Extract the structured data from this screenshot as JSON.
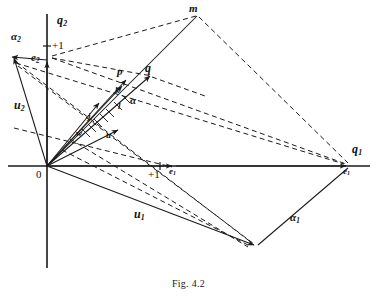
{
  "figure": {
    "caption": "Fig. 4.2",
    "ink_color": "#1a1a1a",
    "background_color": "#ffffff",
    "width": 377,
    "height": 302
  },
  "axes": {
    "origin_label": "0",
    "origin": {
      "x": 47,
      "y": 166
    },
    "horizontal": {
      "name": "q1-axis",
      "label": "q",
      "subscript": "1",
      "x1": 8,
      "x2": 370,
      "y": 166
    },
    "vertical": {
      "name": "q2-axis",
      "label": "q",
      "subscript": "2",
      "y1": 14,
      "y2": 268,
      "x": 47
    }
  },
  "unit_marks": [
    {
      "name": "unit-mark-vertical",
      "label": "+1",
      "x": 52,
      "y": 45
    },
    {
      "name": "unit-mark-horizontal",
      "label": "+1",
      "x": 148,
      "y": 173
    }
  ],
  "points": [
    {
      "name": "point-e2",
      "label": "e",
      "subscript": "2",
      "x": 47,
      "y": 60,
      "label_x": 31,
      "label_y": 53
    },
    {
      "name": "point-e1",
      "label": "e",
      "subscript": "1",
      "x": 174,
      "y": 166,
      "label_x": 170,
      "label_y": 171
    },
    {
      "name": "point-e1-far",
      "label": "e",
      "subscript": "1",
      "x": 348,
      "y": 166,
      "label_x": 344,
      "label_y": 171
    },
    {
      "name": "point-m",
      "label": "m",
      "x": 197,
      "y": 14,
      "label_x": 189,
      "label_y": 4
    },
    {
      "name": "point-p",
      "label": "p",
      "x": 127,
      "y": 78,
      "label_x": 118,
      "label_y": 68
    },
    {
      "name": "point-q",
      "label": "q",
      "x": 151,
      "y": 74,
      "label_x": 146,
      "label_y": 65
    },
    {
      "name": "point-alpha2-tip",
      "label": "α",
      "subscript": "2",
      "x": 10,
      "y": 60,
      "label_x": 12,
      "label_y": 32
    },
    {
      "name": "point-bottom-vertex",
      "x": 256,
      "y": 246
    }
  ],
  "vector_labels": [
    {
      "name": "label-u2",
      "label": "u",
      "subscript": "2",
      "x": 16,
      "y": 105
    },
    {
      "name": "label-u1",
      "label": "u",
      "subscript": "1",
      "x": 136,
      "y": 214
    },
    {
      "name": "label-alpha1",
      "label": "α",
      "subscript": "1",
      "x": 292,
      "y": 218
    },
    {
      "name": "label-alpha",
      "label": "α",
      "x": 131,
      "y": 101
    },
    {
      "name": "label-k",
      "label": "k",
      "x": 116,
      "y": 92
    },
    {
      "name": "label-l",
      "label": "l",
      "x": 118,
      "y": 108
    },
    {
      "name": "label-j",
      "label": "j",
      "x": 89,
      "y": 118
    },
    {
      "name": "label-w",
      "label": "w",
      "x": 78,
      "y": 134
    },
    {
      "name": "label-u-small",
      "label": "u",
      "x": 107,
      "y": 137
    }
  ],
  "solid_segments": [
    {
      "name": "seg-origin-to-alpha2",
      "x1": 47,
      "y1": 60,
      "x2": 12,
      "y2": 57,
      "arrow": true
    },
    {
      "name": "seg-origin-to-e2",
      "x1": 47,
      "y1": 166,
      "x2": 47,
      "y2": 62,
      "arrow": true
    },
    {
      "name": "seg-origin-to-u2tip",
      "x1": 47,
      "y1": 166,
      "x2": 14,
      "y2": 58,
      "arrow": true
    },
    {
      "name": "seg-origin-to-p",
      "x1": 47,
      "y1": 166,
      "x2": 126,
      "y2": 80,
      "arrow": true
    },
    {
      "name": "seg-origin-to-q",
      "x1": 47,
      "y1": 166,
      "x2": 150,
      "y2": 76,
      "arrow": true
    },
    {
      "name": "seg-origin-to-j",
      "x1": 47,
      "y1": 166,
      "x2": 99,
      "y2": 103,
      "arrow": true
    },
    {
      "name": "seg-origin-to-k",
      "x1": 47,
      "y1": 166,
      "x2": 122,
      "y2": 86,
      "arrow": true
    },
    {
      "name": "seg-origin-to-u",
      "x1": 47,
      "y1": 166,
      "x2": 118,
      "y2": 130,
      "arrow": true
    },
    {
      "name": "seg-origin-to-bottom-vertex",
      "x1": 47,
      "y1": 166,
      "x2": 254,
      "y2": 245,
      "arrow": true
    },
    {
      "name": "seg-m-to-origin",
      "x1": 197,
      "y1": 16,
      "x2": 47,
      "y2": 166,
      "arrow": false
    },
    {
      "name": "seg-e1far-to-bottom-vertex",
      "x1": 348,
      "y1": 168,
      "x2": 258,
      "y2": 245,
      "arrow": false
    },
    {
      "name": "seg-origin-to-e1",
      "x1": 47,
      "y1": 166,
      "x2": 172,
      "y2": 166,
      "arrow": true
    },
    {
      "name": "seg-origin-to-e1far",
      "x1": 176,
      "y1": 166,
      "x2": 346,
      "y2": 166,
      "arrow": true
    }
  ],
  "dashed_segments": [
    {
      "name": "dash-e2-to-m",
      "x1": 52,
      "y1": 56,
      "x2": 196,
      "y2": 16
    },
    {
      "name": "dash-e2-to-q",
      "x1": 52,
      "y1": 58,
      "x2": 152,
      "y2": 76
    },
    {
      "name": "dash-e2-to-e1far",
      "x1": 52,
      "y1": 58,
      "x2": 346,
      "y2": 164
    },
    {
      "name": "dash-m-to-e1far",
      "x1": 199,
      "y1": 17,
      "x2": 348,
      "y2": 163
    },
    {
      "name": "dash-q-right",
      "x1": 152,
      "y1": 77,
      "x2": 205,
      "y2": 96
    },
    {
      "name": "dash-alpha2-to-bottom",
      "x1": 16,
      "y1": 62,
      "x2": 252,
      "y2": 243
    },
    {
      "name": "dash-alpha2-to-e1far",
      "x1": 16,
      "y1": 63,
      "x2": 344,
      "y2": 164
    },
    {
      "name": "dash-u2tip-to-bottom",
      "x1": 18,
      "y1": 66,
      "x2": 254,
      "y2": 244
    },
    {
      "name": "dash-origin-diag-low",
      "x1": 62,
      "y1": 150,
      "x2": 250,
      "y2": 246
    },
    {
      "name": "dash-w-to-bottom",
      "x1": 70,
      "y1": 139,
      "x2": 248,
      "y2": 247
    },
    {
      "name": "dash-left-to-e1",
      "x1": 14,
      "y1": 128,
      "x2": 172,
      "y2": 167
    }
  ]
}
